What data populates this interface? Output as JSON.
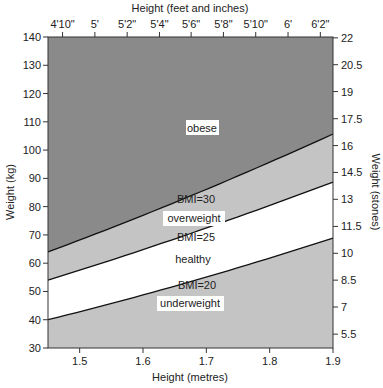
{
  "chart_data": {
    "type": "area",
    "title": "",
    "xlabel": "Height (metres)",
    "ylabel": "Weight (kg)",
    "x2label": "Height (feet and inches)",
    "y2label": "Weight (stones)",
    "xlim": [
      1.45,
      1.9
    ],
    "ylim": [
      30,
      140
    ],
    "x_ticks": [
      1.5,
      1.6,
      1.7,
      1.8,
      1.9
    ],
    "x_tick_labels": [
      "1.5",
      "1.6",
      "1.7",
      "1.8",
      "1.9"
    ],
    "y_ticks": [
      30,
      40,
      50,
      60,
      70,
      80,
      90,
      100,
      110,
      120,
      130,
      140
    ],
    "y_tick_labels": [
      "30",
      "40",
      "50",
      "60",
      "70",
      "80",
      "90",
      "100",
      "110",
      "120",
      "130",
      "140"
    ],
    "x2_ticks": [
      1.473,
      1.524,
      1.575,
      1.626,
      1.676,
      1.727,
      1.778,
      1.829,
      1.88
    ],
    "x2_tick_labels": [
      "4'10\"",
      "5'",
      "5'2\"",
      "5'4\"",
      "5'6\"",
      "5'8\"",
      "5'10\"",
      "6'",
      "6'2\""
    ],
    "y2_ticks": [
      34.9,
      44.5,
      54.0,
      63.5,
      73.0,
      82.6,
      92.1,
      101.6,
      111.1,
      120.7,
      130.2,
      139.7
    ],
    "y2_tick_labels": [
      "5.5",
      "7",
      "8.5",
      "10",
      "11.5",
      "13",
      "14.5",
      "16",
      "17.5",
      "19",
      "20.5",
      "22"
    ],
    "grid": false,
    "series": [
      {
        "name": "BMI=20",
        "x": [
          1.45,
          1.9
        ],
        "values": [
          40,
          68.9
        ]
      },
      {
        "name": "BMI=25",
        "x": [
          1.45,
          1.9
        ],
        "values": [
          54,
          88.7
        ]
      },
      {
        "name": "BMI=30",
        "x": [
          1.45,
          1.9
        ],
        "values": [
          64,
          105.7
        ]
      }
    ],
    "regions": [
      {
        "name": "underweight",
        "below": "BMI=20",
        "color": "#c4c4c4"
      },
      {
        "name": "healthy",
        "between": [
          "BMI=20",
          "BMI=25"
        ],
        "color": "#ffffff"
      },
      {
        "name": "overweight",
        "between": [
          "BMI=25",
          "BMI=30"
        ],
        "color": "#c4c4c4"
      },
      {
        "name": "obese",
        "above": "BMI=30",
        "color": "#8a8a8a"
      }
    ],
    "annotations": [
      "obese",
      "BMI=30",
      "overweight",
      "BMI=25",
      "healthy",
      "BMI=20",
      "underweight"
    ]
  },
  "labels": {
    "obese": "obese",
    "bmi30": "BMI=30",
    "overweight": "overweight",
    "bmi25": "BMI=25",
    "healthy": "healthy",
    "bmi20": "BMI=20",
    "underweight": "underweight"
  },
  "axes": {
    "top_title": "Height (feet and inches)",
    "bottom_title": "Height (metres)",
    "left_title": "Weight (kg)",
    "right_title": "Weight (stones)"
  },
  "colors": {
    "obese": "#8a8a8a",
    "overweight": "#c4c4c4",
    "healthy": "#ffffff",
    "underweight": "#c4c4c4",
    "line": "#111111"
  }
}
